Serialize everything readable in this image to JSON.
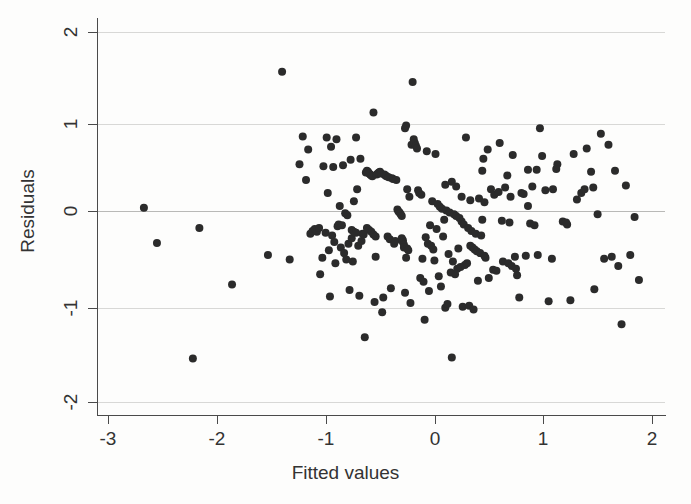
{
  "chart_data": {
    "type": "scatter",
    "title": "",
    "xlabel": "Fitted values",
    "ylabel": "Residuals",
    "xlim": [
      -3.18,
      2.12
    ],
    "ylim": [
      -2.1,
      2.13
    ],
    "xticks": [
      -3,
      -2,
      -1,
      0,
      1,
      2
    ],
    "xticklabels": [
      "-3",
      "-2",
      "-1",
      "0",
      "1",
      "2"
    ],
    "yticks": [
      -2,
      -1,
      0,
      1,
      2
    ],
    "yticklabels": [
      "-2",
      "-1",
      "0",
      "1",
      "2"
    ],
    "grid": "horizontal",
    "gridlines_y": [
      -2,
      -1,
      0,
      1,
      2
    ],
    "legend": "none",
    "marker": "filled-circle",
    "marker_color": "#2b2b2b",
    "marker_size_px": 8,
    "n_points": 231,
    "series": [
      {
        "name": "residuals",
        "points": [
          [
            -2.67,
            0.1
          ],
          [
            -2.55,
            -0.28
          ],
          [
            -2.16,
            -0.12
          ],
          [
            -1.86,
            -0.73
          ],
          [
            -2.22,
            -1.53
          ],
          [
            -1.53,
            -0.41
          ],
          [
            -1.4,
            1.57
          ],
          [
            -1.33,
            -0.46
          ],
          [
            -1.24,
            0.57
          ],
          [
            -1.21,
            0.87
          ],
          [
            -1.18,
            0.4
          ],
          [
            -1.16,
            0.73
          ],
          [
            -1.14,
            -0.18
          ],
          [
            -1.12,
            -0.15
          ],
          [
            -1.1,
            -0.13
          ],
          [
            -1.08,
            -0.16
          ],
          [
            -1.06,
            -0.12
          ],
          [
            -1.05,
            -0.62
          ],
          [
            -1.03,
            -0.44
          ],
          [
            -1.02,
            0.55
          ],
          [
            -1.0,
            -0.17
          ],
          [
            -0.99,
            0.86
          ],
          [
            -0.98,
            0.26
          ],
          [
            -0.97,
            -0.36
          ],
          [
            -0.96,
            -0.86
          ],
          [
            -0.95,
            0.76
          ],
          [
            -0.94,
            -0.2
          ],
          [
            -0.93,
            0.54
          ],
          [
            -0.92,
            -0.27
          ],
          [
            -0.91,
            -0.5
          ],
          [
            -0.9,
            0.84
          ],
          [
            -0.89,
            -0.1
          ],
          [
            -0.88,
            -0.08
          ],
          [
            -0.87,
            0.12
          ],
          [
            -0.86,
            -0.33
          ],
          [
            -0.85,
            -0.09
          ],
          [
            -0.84,
            0.56
          ],
          [
            -0.83,
            -0.39
          ],
          [
            -0.82,
            0.04
          ],
          [
            -0.81,
            -0.46
          ],
          [
            -0.8,
            0.02
          ],
          [
            -0.79,
            -0.29
          ],
          [
            -0.78,
            -0.79
          ],
          [
            -0.77,
            0.62
          ],
          [
            -0.76,
            -0.23
          ],
          [
            -0.75,
            -0.48
          ],
          [
            -0.74,
            0.17
          ],
          [
            -0.72,
            0.86
          ],
          [
            -0.71,
            0.3
          ],
          [
            -0.7,
            -0.31
          ],
          [
            -0.69,
            -0.85
          ],
          [
            -0.68,
            0.63
          ],
          [
            -0.67,
            -0.26
          ],
          [
            -0.66,
            -0.18
          ],
          [
            -0.65,
            -0.19
          ],
          [
            -0.64,
            -1.3
          ],
          [
            -0.63,
            0.48
          ],
          [
            -0.62,
            0.5
          ],
          [
            -0.61,
            0.49
          ],
          [
            -0.6,
            0.47
          ],
          [
            -0.59,
            0.46
          ],
          [
            -0.58,
            0.45
          ],
          [
            -0.57,
            0.44
          ],
          [
            -0.56,
            1.13
          ],
          [
            -0.55,
            -0.92
          ],
          [
            -0.54,
            -0.43
          ],
          [
            -0.53,
            0.46
          ],
          [
            -0.52,
            0.47
          ],
          [
            -0.51,
            0.48
          ],
          [
            -0.5,
            0.49
          ],
          [
            -0.49,
            0.47
          ],
          [
            -0.48,
            -1.03
          ],
          [
            -0.47,
            -0.87
          ],
          [
            -0.46,
            0.46
          ],
          [
            -0.45,
            0.45
          ],
          [
            -0.44,
            0.44
          ],
          [
            -0.43,
            -0.21
          ],
          [
            -0.42,
            0.43
          ],
          [
            -0.41,
            -0.24
          ],
          [
            -0.4,
            -0.77
          ],
          [
            -0.39,
            0.42
          ],
          [
            -0.38,
            0.41
          ],
          [
            -0.37,
            -0.29
          ],
          [
            -0.36,
            -0.26
          ],
          [
            -0.35,
            0.4
          ],
          [
            -0.34,
            0.08
          ],
          [
            -0.33,
            0.06
          ],
          [
            -0.32,
            0.05
          ],
          [
            -0.31,
            0.03
          ],
          [
            -0.3,
            0.01
          ],
          [
            -0.3,
            -0.23
          ],
          [
            -0.29,
            -0.25
          ],
          [
            -0.29,
            -0.27
          ],
          [
            -0.28,
            -0.3
          ],
          [
            -0.28,
            -0.33
          ],
          [
            -0.27,
            -0.82
          ],
          [
            -0.27,
            0.96
          ],
          [
            -0.26,
            -0.44
          ],
          [
            -0.26,
            0.99
          ],
          [
            -0.25,
            0.3
          ],
          [
            -0.25,
            -0.34
          ],
          [
            -0.24,
            -0.36
          ],
          [
            -0.23,
            0.22
          ],
          [
            -0.22,
            -0.93
          ],
          [
            -0.21,
            0.78
          ],
          [
            -0.2,
            1.46
          ],
          [
            -0.19,
            0.84
          ],
          [
            -0.18,
            0.8
          ],
          [
            -0.17,
            0.77
          ],
          [
            -0.16,
            0.74
          ],
          [
            -0.15,
            0.29
          ],
          [
            -0.14,
            0.26
          ],
          [
            -0.13,
            -0.66
          ],
          [
            -0.12,
            0.24
          ],
          [
            -0.11,
            -0.45
          ],
          [
            -0.1,
            -0.7
          ],
          [
            -0.09,
            -1.11
          ],
          [
            -0.08,
            -0.22
          ],
          [
            -0.07,
            0.71
          ],
          [
            -0.06,
            -0.29
          ],
          [
            -0.05,
            -0.8
          ],
          [
            -0.04,
            -0.09
          ],
          [
            -0.03,
            -0.31
          ],
          [
            -0.02,
            0.17
          ],
          [
            -0.01,
            -0.35
          ],
          [
            0.0,
            -0.47
          ],
          [
            0.01,
            0.68
          ],
          [
            0.02,
            -0.13
          ],
          [
            0.03,
            0.14
          ],
          [
            0.04,
            -0.64
          ],
          [
            0.05,
            0.11
          ],
          [
            0.06,
            -0.75
          ],
          [
            0.07,
            0.09
          ],
          [
            0.08,
            -0.21
          ],
          [
            0.09,
            -0.03
          ],
          [
            0.1,
            -0.98
          ],
          [
            0.11,
            0.07
          ],
          [
            0.12,
            -0.94
          ],
          [
            0.13,
            -0.4
          ],
          [
            0.14,
            0.05
          ],
          [
            0.15,
            -0.6
          ],
          [
            0.16,
            -1.52
          ],
          [
            0.17,
            -0.48
          ],
          [
            0.18,
            0.03
          ],
          [
            0.19,
            -0.62
          ],
          [
            0.2,
            0.01
          ],
          [
            0.21,
            -0.56
          ],
          [
            0.22,
            -0.34
          ],
          [
            0.23,
            -0.01
          ],
          [
            0.24,
            -0.54
          ],
          [
            0.25,
            -0.05
          ],
          [
            0.26,
            -0.97
          ],
          [
            0.27,
            -0.08
          ],
          [
            0.28,
            -0.52
          ],
          [
            0.29,
            0.86
          ],
          [
            0.3,
            -0.5
          ],
          [
            0.31,
            -0.12
          ],
          [
            0.32,
            -0.96
          ],
          [
            0.33,
            -0.31
          ],
          [
            0.34,
            -0.15
          ],
          [
            0.35,
            -0.33
          ],
          [
            0.36,
            -1.0
          ],
          [
            0.37,
            -0.35
          ],
          [
            0.38,
            -0.18
          ],
          [
            0.39,
            -0.37
          ],
          [
            0.4,
            -0.69
          ],
          [
            0.41,
            0.2
          ],
          [
            0.42,
            -0.39
          ],
          [
            0.43,
            -0.2
          ],
          [
            0.44,
            0.5
          ],
          [
            0.45,
            0.63
          ],
          [
            0.46,
            -0.42
          ],
          [
            0.47,
            -0.44
          ],
          [
            0.49,
            0.73
          ],
          [
            0.5,
            -0.66
          ],
          [
            0.52,
            0.3
          ],
          [
            0.54,
            -0.57
          ],
          [
            0.55,
            0.24
          ],
          [
            0.57,
            -0.58
          ],
          [
            0.59,
            0.27
          ],
          [
            0.6,
            0.8
          ],
          [
            0.62,
            -0.04
          ],
          [
            0.63,
            -0.48
          ],
          [
            0.65,
            0.32
          ],
          [
            0.67,
            0.45
          ],
          [
            0.69,
            -0.06
          ],
          [
            0.7,
            0.22
          ],
          [
            0.72,
            0.67
          ],
          [
            0.74,
            -0.43
          ],
          [
            0.76,
            -0.63
          ],
          [
            0.78,
            -0.87
          ],
          [
            0.8,
            0.26
          ],
          [
            0.82,
            0.25
          ],
          [
            0.84,
            -0.42
          ],
          [
            0.86,
            0.51
          ],
          [
            0.88,
            -0.07
          ],
          [
            0.9,
            0.33
          ],
          [
            0.92,
            -0.09
          ],
          [
            0.94,
            0.51
          ],
          [
            0.95,
            -0.41
          ],
          [
            0.97,
            0.96
          ],
          [
            0.99,
            0.66
          ],
          [
            1.02,
            0.29
          ],
          [
            1.05,
            -0.91
          ],
          [
            1.08,
            -0.45
          ],
          [
            1.13,
            0.57
          ],
          [
            1.18,
            -0.05
          ],
          [
            1.22,
            -0.08
          ],
          [
            1.25,
            -0.9
          ],
          [
            1.28,
            0.68
          ],
          [
            1.31,
            0.19
          ],
          [
            1.35,
            0.26
          ],
          [
            1.38,
            0.3
          ],
          [
            1.4,
            0.74
          ],
          [
            1.44,
            0.49
          ],
          [
            1.47,
            -0.78
          ],
          [
            1.5,
            0.03
          ],
          [
            1.53,
            0.9
          ],
          [
            1.56,
            -0.45
          ],
          [
            1.6,
            0.78
          ],
          [
            1.63,
            -0.43
          ],
          [
            1.66,
            0.5
          ],
          [
            1.69,
            -0.53
          ],
          [
            1.72,
            -1.16
          ],
          [
            1.76,
            0.34
          ],
          [
            1.8,
            -0.41
          ],
          [
            1.84,
            0.0
          ],
          [
            1.88,
            -0.68
          ],
          [
            1.21,
            -0.06
          ],
          [
            1.46,
            0.32
          ],
          [
            0.44,
            -0.03
          ],
          [
            0.33,
            0.18
          ],
          [
            -0.62,
            -0.12
          ],
          [
            -0.6,
            -0.14
          ],
          [
            -0.58,
            -0.16
          ],
          [
            -0.56,
            -0.19
          ],
          [
            -0.54,
            -0.21
          ],
          [
            -0.76,
            -0.14
          ],
          [
            -0.74,
            -0.16
          ],
          [
            -0.72,
            -0.17
          ],
          [
            0.68,
            -0.5
          ],
          [
            0.71,
            -0.53
          ],
          [
            0.75,
            -0.56
          ],
          [
            1.12,
            0.52
          ],
          [
            1.09,
            0.3
          ],
          [
            0.86,
            0.12
          ],
          [
            0.46,
            0.16
          ],
          [
            0.25,
            0.22
          ],
          [
            0.2,
            0.33
          ],
          [
            0.16,
            0.38
          ],
          [
            0.1,
            0.35
          ]
        ]
      }
    ]
  },
  "axes": {
    "x": {
      "label": "Fitted values",
      "ticks": [
        {
          "value": "-3",
          "px": 108
        },
        {
          "value": "-2",
          "px": 217
        },
        {
          "value": "-1",
          "px": 326
        },
        {
          "value": "0",
          "px": 435
        },
        {
          "value": "1",
          "px": 543
        },
        {
          "value": "2",
          "px": 652
        }
      ]
    },
    "y": {
      "label": "Residuals",
      "ticks": [
        {
          "value": "2",
          "px": 32
        },
        {
          "value": "1",
          "px": 124
        },
        {
          "value": "0",
          "px": 211
        },
        {
          "value": "-1",
          "px": 308
        },
        {
          "value": "-2",
          "px": 402
        }
      ]
    }
  },
  "colors": {
    "marker": "#2b2b2b",
    "axis": "#4a4a4a",
    "gridline": "#d8d8d6",
    "gridline_zero": "#b9b9b7",
    "text": "#333333",
    "background": "#fdfdfc",
    "plot_background": "#fefefe"
  }
}
